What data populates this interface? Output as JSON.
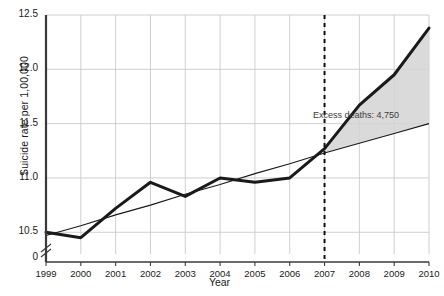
{
  "chart_data": {
    "type": "line",
    "title": "",
    "xlabel": "Year",
    "ylabel": "Suicide rate per 1,00,000",
    "x": [
      1999,
      2000,
      2001,
      2002,
      2003,
      2004,
      2005,
      2006,
      2007,
      2008,
      2009,
      2010
    ],
    "xticklabels": [
      "1999",
      "2000",
      "2001",
      "2002",
      "2003",
      "2004",
      "2005",
      "2006",
      "2007",
      "2008",
      "2009",
      "2010"
    ],
    "yticklabels": [
      "0",
      "10.5",
      "11.0",
      "11.5",
      "12.0",
      "12.5"
    ],
    "ytickvalues": [
      10.5,
      11.0,
      11.5,
      12.0,
      12.5
    ],
    "ylim": [
      10.3,
      12.5
    ],
    "xlim": [
      1999,
      2010
    ],
    "grid": true,
    "legend_position": "none",
    "axis_break": true,
    "series": [
      {
        "name": "Observed suicide rate",
        "style": "thick-solid",
        "color": "#1a1a1a",
        "values": [
          10.5,
          10.45,
          10.72,
          10.96,
          10.83,
          11.0,
          10.96,
          11.0,
          11.27,
          11.67,
          11.95,
          12.38
        ]
      },
      {
        "name": "Expected trend",
        "style": "thin-solid",
        "color": "#1a1a1a",
        "values": [
          10.47,
          10.56,
          10.66,
          10.75,
          10.85,
          10.94,
          11.04,
          11.13,
          11.23,
          11.32,
          11.41,
          11.5
        ]
      }
    ],
    "shaded_region": {
      "label": "Excess deaths: 4,750",
      "from_x": 2007,
      "to_x": 2010,
      "color": "#d4d4d4"
    },
    "vertical_marker": {
      "x": 2007,
      "style": "dashed",
      "color": "#111111"
    },
    "annotations": [
      {
        "text": "Excess deaths: 4,750",
        "x": 2007.6,
        "y": 11.55
      }
    ]
  }
}
